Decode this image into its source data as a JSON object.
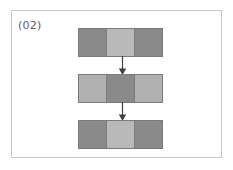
{
  "figure": {
    "panel_label": "(02)",
    "background_color": "#ffffff",
    "frame_color": "#c9c9c9",
    "label_color": "#5d5d5d",
    "outline_color": "#7b7b7b",
    "arrow_color": "#3f3f3f"
  },
  "palette": {
    "dark": "#8a8a8a",
    "light": "#b9b9b9",
    "darker": "#7e7e7e"
  },
  "diagram": {
    "type": "flow",
    "rows": [
      {
        "id": "row-1",
        "cells": [
          {
            "id": "row-1-cell-left",
            "shade": "dark",
            "color": "#8a8a8a"
          },
          {
            "id": "row-1-cell-middle",
            "shade": "light",
            "color": "#b9b9b9"
          },
          {
            "id": "row-1-cell-right",
            "shade": "dark",
            "color": "#8a8a8a"
          }
        ]
      },
      {
        "id": "row-2",
        "cells": [
          {
            "id": "row-2-cell-left",
            "shade": "light",
            "color": "#b0b0b0"
          },
          {
            "id": "row-2-cell-middle",
            "shade": "darker",
            "color": "#8a8a8a"
          },
          {
            "id": "row-2-cell-right",
            "shade": "light",
            "color": "#b0b0b0"
          }
        ]
      },
      {
        "id": "row-3",
        "cells": [
          {
            "id": "row-3-cell-left",
            "shade": "dark",
            "color": "#8a8a8a"
          },
          {
            "id": "row-3-cell-middle",
            "shade": "light",
            "color": "#b9b9b9"
          },
          {
            "id": "row-3-cell-right",
            "shade": "dark",
            "color": "#8a8a8a"
          }
        ]
      }
    ],
    "arrows": [
      {
        "id": "arrow-1",
        "from": "row-1",
        "to": "row-2",
        "direction": "down"
      },
      {
        "id": "arrow-2",
        "from": "row-2",
        "to": "row-3",
        "direction": "down"
      }
    ]
  }
}
